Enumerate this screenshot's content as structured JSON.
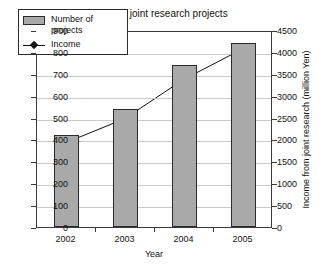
{
  "chart_data": {
    "type": "bar",
    "title": "Number of joint research projects",
    "xlabel": "Year",
    "ylabel": "",
    "y2label": "Income from joint research (million Yen)",
    "categories": [
      "2002",
      "2003",
      "2004",
      "2005"
    ],
    "grid": true,
    "legend_position": "upper-left",
    "ylim": [
      0,
      900
    ],
    "yticks": [
      "0",
      "100",
      "200",
      "300",
      "400",
      "500",
      "600",
      "700",
      "800",
      "900"
    ],
    "y2lim": [
      0,
      4500
    ],
    "y2ticks": [
      "0",
      "500",
      "1000",
      "1500",
      "2000",
      "2500",
      "3000",
      "3500",
      "4000",
      "4500"
    ],
    "series": [
      {
        "name": "Number of projects",
        "kind": "bar",
        "axis": "left",
        "color": "#a9a9a9",
        "edge_color": "#2b2b2b",
        "values": [
          420,
          540,
          740,
          840
        ]
      },
      {
        "name": "Income",
        "kind": "line",
        "axis": "right",
        "color": "#111111",
        "marker": "diamond",
        "values": [
          1950,
          2500,
          3400,
          4100
        ]
      }
    ]
  },
  "legend": {
    "items": [
      {
        "label": "Number of projects",
        "swatch": "bar-swatch"
      },
      {
        "label": "Income",
        "swatch": "line-marker-swatch"
      }
    ]
  }
}
